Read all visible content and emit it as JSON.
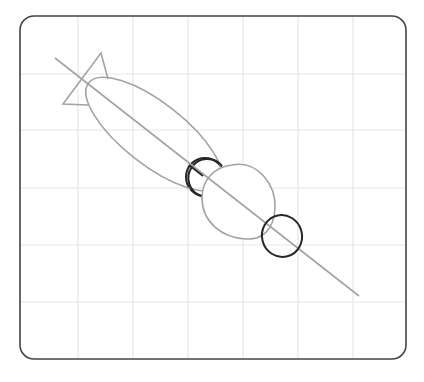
{
  "diagram": {
    "colors": {
      "background": "#ffffff",
      "frame": "#444444",
      "grid": "#e6e6e6",
      "guide_stroke": "#a3a3a3",
      "dark_stroke": "#262626"
    },
    "frame": {
      "x": 20,
      "y": 16,
      "width": 386,
      "height": 343,
      "radius": 14
    },
    "grid": {
      "vertical_x": [
        78,
        133,
        188,
        243,
        298,
        353
      ],
      "horizontal_y": [
        74,
        130,
        188,
        245,
        302
      ]
    },
    "guide_line": {
      "x1": 55,
      "y1": 58,
      "x2": 359,
      "y2": 296
    },
    "fin": {
      "points": "101,53 108,79 M 88,105 63,104 101,53"
    },
    "large_ellipse": {
      "cx": 154,
      "cy": 134,
      "rx": 83,
      "ry": 31,
      "angle": 38
    },
    "egg": {
      "cx": 238,
      "cy": 202,
      "rx": 36,
      "ry": 37,
      "angle": -30
    },
    "dark_circle_1": {
      "cx": 205,
      "cy": 177,
      "r": 19
    },
    "dark_circle_2": {
      "cx": 282,
      "cy": 236,
      "rx": 20,
      "ry": 21
    }
  }
}
